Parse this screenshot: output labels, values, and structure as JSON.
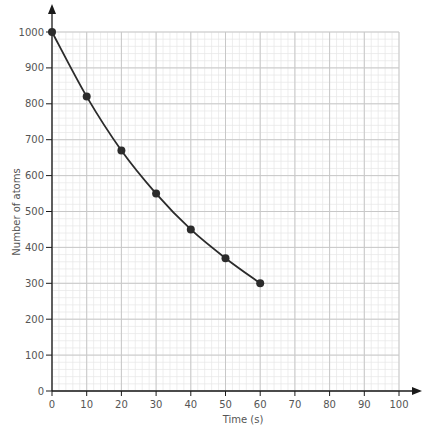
{
  "chart_data": {
    "type": "line",
    "title": "",
    "xlabel": "Time (s)",
    "ylabel": "Number of atoms",
    "xlim": [
      0,
      100
    ],
    "ylim": [
      0,
      1000
    ],
    "x_ticks": [
      0,
      10,
      20,
      30,
      40,
      50,
      60,
      70,
      80,
      90,
      100
    ],
    "y_ticks": [
      0,
      100,
      200,
      300,
      400,
      500,
      600,
      700,
      800,
      900,
      1000
    ],
    "grid": true,
    "grid_minor_x_step": 2,
    "grid_minor_y_step": 20,
    "legend": null,
    "series": [
      {
        "name": "Number of atoms",
        "x": [
          0,
          10,
          20,
          30,
          40,
          50,
          60
        ],
        "values": [
          1000,
          820,
          670,
          550,
          450,
          370,
          300
        ],
        "markers": true,
        "smooth": true
      }
    ]
  },
  "colors": {
    "line": "#2b2b2b",
    "axis": "#1a1a1a",
    "grid_major": "#c8c8c8",
    "grid_minor": "#e6e6e6",
    "text": "#555555"
  }
}
